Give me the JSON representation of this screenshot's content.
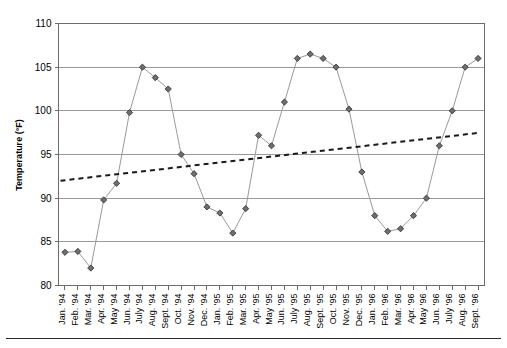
{
  "chart_data": {
    "type": "line",
    "title": "",
    "xlabel": "",
    "ylabel": "Temperature (°F)",
    "ylim": [
      80,
      110
    ],
    "ytick_values": [
      80,
      85,
      90,
      95,
      100,
      105,
      110
    ],
    "ytick_labels": [
      "80",
      "85",
      "90",
      "95",
      "100",
      "105",
      "110"
    ],
    "grid": true,
    "legend": "none",
    "categories": [
      "Jan. '94",
      "Feb. '94",
      "Mar. '94",
      "Apr. '94",
      "May '94",
      "Jun. '94",
      "July '94",
      "Aug. '94",
      "Sept. '94",
      "Oct. '94",
      "Nov. '94",
      "Dec. '94",
      "Jan. '95",
      "Feb. '95",
      "Mar. '95",
      "Apr. '95",
      "May '95",
      "Jun. '95",
      "July '95",
      "Aug. '95",
      "Sept. '95",
      "Oct. '95",
      "Nov. '95",
      "Dec. '95",
      "Jan. '96",
      "Feb. '96",
      "Mar. '96",
      "Apr. '96",
      "May '96",
      "Jun. '96",
      "July '96",
      "Aug. '96",
      "Sept. '96"
    ],
    "series": [
      {
        "name": "Temperature",
        "style": "solid-line-with-diamond-markers",
        "values": [
          83.8,
          83.9,
          82.0,
          89.8,
          91.7,
          99.8,
          105.0,
          103.8,
          102.5,
          95.0,
          92.8,
          89.0,
          88.3,
          86.0,
          88.8,
          97.2,
          96.0,
          101.0,
          106.0,
          106.5,
          106.0,
          105.0,
          100.2,
          93.0,
          88.0,
          86.2,
          86.5,
          88.0,
          90.0,
          96.0,
          100.0,
          105.0,
          106.0
        ]
      }
    ],
    "trendline": {
      "name": "Linear trend",
      "style": "dotted",
      "start_value": 92.0,
      "end_value": 97.5
    }
  }
}
